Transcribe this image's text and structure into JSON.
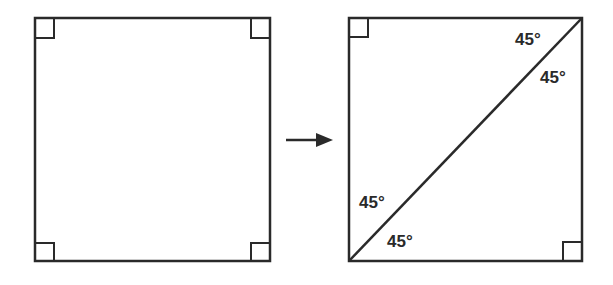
{
  "diagram": {
    "left_square": {
      "label": "square",
      "right_angle_markers": 4
    },
    "arrow": {
      "direction": "right"
    },
    "right_square": {
      "label": "square divided by diagonal",
      "right_angle_markers": 2,
      "angles": {
        "top_right_upper": "45°",
        "top_right_lower": "45°",
        "bottom_left_upper": "45°",
        "bottom_left_lower": "45°"
      }
    },
    "stroke_color": "#2a2a2a"
  }
}
